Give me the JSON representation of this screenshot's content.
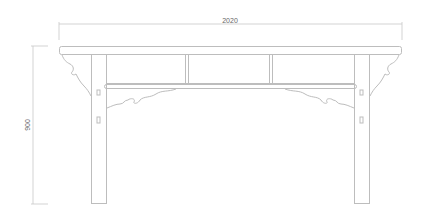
{
  "drawing": {
    "title": "Table front elevation",
    "dimensions": {
      "width_label": "2020",
      "height_label": "900"
    },
    "colors": {
      "line": "#bdbdbd",
      "dimension_line": "#c8c8c8",
      "label": "#666666",
      "background": "#ffffff"
    },
    "parts": [
      "table-top",
      "apron",
      "upper-rail",
      "lower-rail",
      "left-leg",
      "right-leg",
      "left-corner-bracket",
      "right-corner-bracket",
      "left-apron-carving",
      "right-apron-carving",
      "panel-dividers"
    ]
  }
}
